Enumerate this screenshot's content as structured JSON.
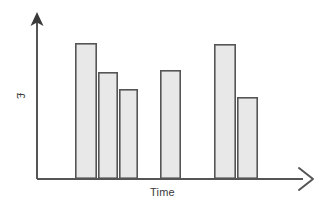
{
  "chart_data": {
    "type": "bar",
    "title": "",
    "subtitle": "",
    "xlabel": "Time",
    "ylabel": "£",
    "grid": false,
    "legend": null,
    "axis_style": {
      "x_axis_arrow": "open-chevron-right",
      "y_axis_arrow": "solid-triangle-up",
      "tick_labels": "none",
      "axis_color": "#555555"
    },
    "bar_style": {
      "fill": "#e8e8e8",
      "stroke": "#555555",
      "stroke_width": 1.6
    },
    "categories": [
      "1",
      "2",
      "3",
      "4",
      "5",
      "6"
    ],
    "groups": [
      {
        "name": "group-1",
        "bar_indices": [
          0,
          1,
          2
        ]
      },
      {
        "name": "group-2",
        "bar_indices": [
          3
        ]
      },
      {
        "name": "group-3",
        "bar_indices": [
          4,
          5
        ]
      }
    ],
    "values": [
      100,
      79,
      66,
      80,
      99,
      60
    ],
    "ylim": [
      0,
      125
    ],
    "xlim": [
      0,
      6
    ],
    "bars": [
      {
        "name": "bar-1",
        "group": "group-1",
        "value": 100,
        "x_px": 75,
        "width_px": 22,
        "top_px": 43
      },
      {
        "name": "bar-2",
        "group": "group-1",
        "value": 79,
        "x_px": 98,
        "width_px": 20,
        "top_px": 72
      },
      {
        "name": "bar-3",
        "group": "group-1",
        "value": 66,
        "x_px": 119,
        "width_px": 19,
        "top_px": 89
      },
      {
        "name": "bar-4",
        "group": "group-2",
        "value": 80,
        "x_px": 160,
        "width_px": 21,
        "top_px": 70
      },
      {
        "name": "bar-5",
        "group": "group-3",
        "value": 99,
        "x_px": 214,
        "width_px": 22,
        "top_px": 44
      },
      {
        "name": "bar-6",
        "group": "group-3",
        "value": 60,
        "x_px": 237,
        "width_px": 21,
        "top_px": 97
      }
    ]
  }
}
